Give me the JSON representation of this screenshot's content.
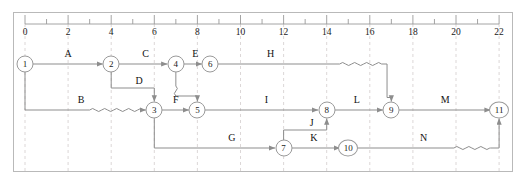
{
  "diagram": {
    "type": "activity-on-arrow-network",
    "title": "",
    "axis": {
      "origin_px": 25,
      "unit_px": 21.55,
      "min": 0,
      "max": 22,
      "major_step": 2,
      "minor_step": 1,
      "tick_labels": [
        "0",
        "2",
        "4",
        "6",
        "8",
        "10",
        "12",
        "14",
        "16",
        "18",
        "20",
        "22"
      ],
      "tick_values": [
        0,
        2,
        4,
        6,
        8,
        10,
        12,
        14,
        16,
        18,
        20,
        22
      ],
      "gridline_color": "#d8d2d2",
      "ruler_color": "#9a9a9a"
    },
    "rows": {
      "top_y": 64,
      "middle_y": 110,
      "bottom_y": 148
    },
    "nodes": [
      {
        "id": "1",
        "label": "1",
        "t": 0,
        "row": "top"
      },
      {
        "id": "2",
        "label": "2",
        "t": 4,
        "row": "top"
      },
      {
        "id": "4",
        "label": "4",
        "t": 7,
        "row": "top"
      },
      {
        "id": "6",
        "label": "6",
        "t": 8.6,
        "row": "top"
      },
      {
        "id": "3",
        "label": "3",
        "t": 6,
        "row": "middle"
      },
      {
        "id": "5",
        "label": "5",
        "t": 8,
        "row": "middle"
      },
      {
        "id": "8",
        "label": "8",
        "t": 14,
        "row": "middle"
      },
      {
        "id": "9",
        "label": "9",
        "t": 17,
        "row": "middle"
      },
      {
        "id": "11",
        "label": "11",
        "t": 22,
        "row": "middle"
      },
      {
        "id": "7",
        "label": "7",
        "t": 12,
        "row": "bottom"
      },
      {
        "id": "10",
        "label": "10",
        "t": 15,
        "row": "bottom"
      }
    ],
    "activities": [
      {
        "name": "A",
        "from": "1",
        "to": "2",
        "label_t": 2.0,
        "row": "top",
        "float": false
      },
      {
        "name": "C",
        "from": "2",
        "to": "4",
        "label_t": 5.6,
        "row": "top",
        "float": false
      },
      {
        "name": "E",
        "from": "4",
        "to": "6",
        "label_t": 7.9,
        "row": "top",
        "float": false
      },
      {
        "name": "H",
        "from": "6",
        "to": "9",
        "label_t": 11.4,
        "row": "top",
        "float": true,
        "float_from_t": 14.6,
        "float_to_t": 16.8
      },
      {
        "name": "B",
        "from": "1",
        "to": "3",
        "label_t": 2.6,
        "row": "middle",
        "float": true,
        "float_from_t": 3.0,
        "float_to_t": 5.6
      },
      {
        "name": "D",
        "from": "2",
        "to": "3",
        "label_t": 5.3,
        "row": "dummy",
        "float": false
      },
      {
        "name": "F",
        "from": "3",
        "to": "5",
        "label_t": 7.0,
        "row": "middle",
        "float": false
      },
      {
        "name": "I",
        "from": "5",
        "to": "8",
        "label_t": 11.2,
        "row": "middle",
        "float": false
      },
      {
        "name": "L",
        "from": "8",
        "to": "9",
        "label_t": 15.4,
        "row": "middle",
        "float": false
      },
      {
        "name": "M",
        "from": "9",
        "to": "11",
        "label_t": 19.5,
        "row": "middle",
        "float": false
      },
      {
        "name": "G",
        "from": "3",
        "to": "7",
        "label_t": 9.6,
        "row": "bottom",
        "float": false
      },
      {
        "name": "K",
        "from": "7",
        "to": "10",
        "label_t": 13.4,
        "row": "bottom",
        "float": false
      },
      {
        "name": "J",
        "from": "7",
        "to": "8",
        "label_t": 13.3,
        "row": "dummy",
        "float": false
      },
      {
        "name": "N",
        "from": "10",
        "to": "11",
        "label_t": 18.5,
        "row": "bottom",
        "float": true,
        "float_from_t": 19.9,
        "float_to_t": 21.6
      }
    ],
    "colors": {
      "arrow": "#8d8d8d",
      "node_stroke": "#9a9a9a",
      "text": "#1a1a1a",
      "grid": "#d8d2d2",
      "border": "#b9b9b9",
      "background": "#ffffff"
    }
  }
}
